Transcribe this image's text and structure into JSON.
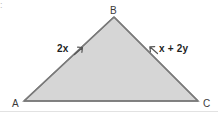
{
  "figure": {
    "kind": "geometry-diagram",
    "shape": "triangle",
    "corner_mark": ":",
    "colors": {
      "background": "#ffffff",
      "fill": "#d6d6d6",
      "fill_shade": "#cfcfcf",
      "stroke": "#7a7a7a",
      "label": "#3a3a3a",
      "side_label": "#1f1f1f",
      "rule": "#e2e2e2"
    },
    "vertices": [
      {
        "name": "B",
        "label": "B",
        "x": 114,
        "y": 17
      },
      {
        "name": "A",
        "label": "A",
        "x": 24,
        "y": 101
      },
      {
        "name": "C",
        "label": "C",
        "x": 198,
        "y": 101
      }
    ],
    "vertex_labels": [
      {
        "name": "vertex-label-b",
        "text": "B",
        "left": 110,
        "top": 6
      },
      {
        "name": "vertex-label-a",
        "text": "A",
        "left": 12,
        "top": 99
      },
      {
        "name": "vertex-label-c",
        "text": "C",
        "left": 203,
        "top": 99
      }
    ],
    "side_labels": [
      {
        "name": "side-label-ab",
        "text": "2x",
        "side": "AB",
        "left": 57,
        "top": 44
      },
      {
        "name": "side-label-bc",
        "text": "x + 2y",
        "side": "BC",
        "left": 159,
        "top": 44
      }
    ],
    "tick_marks": [
      {
        "name": "tick-ab",
        "x": 79,
        "y": 51,
        "points_to": "AB"
      },
      {
        "name": "tick-bc",
        "x": 153,
        "y": 49,
        "points_to": "BC"
      }
    ]
  }
}
